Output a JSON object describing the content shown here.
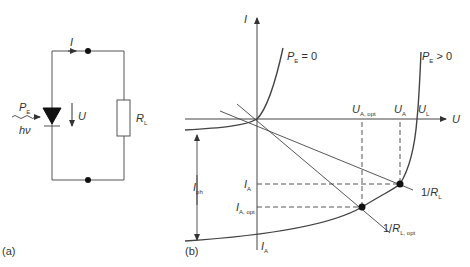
{
  "panel_a": {
    "label": "(a)",
    "current_symbol": "I",
    "voltage_symbol": "U",
    "resistor_symbol": "R",
    "resistor_sub": "L",
    "power_symbol": "P",
    "power_sub": "E",
    "photon_label": "hν"
  },
  "panel_b": {
    "label": "(b)",
    "y_axis": "I",
    "x_axis": "U",
    "curve_dark": {
      "symbol": "P",
      "sub": "E",
      "cond": " = 0"
    },
    "curve_light": {
      "symbol": "P",
      "sub": "E",
      "cond": " > 0"
    },
    "u_a_opt": {
      "symbol": "U",
      "sub": "A, opt"
    },
    "u_a": {
      "symbol": "U",
      "sub": "A"
    },
    "u_l": {
      "symbol": "U",
      "sub": "L"
    },
    "i_a": {
      "symbol": "I",
      "sub": "A"
    },
    "i_a_opt": {
      "symbol": "I",
      "sub": "A, opt"
    },
    "i_ph": {
      "symbol": "I",
      "sub": "ph"
    },
    "i_a_bottom": {
      "symbol": "I",
      "sub": "A"
    },
    "load_line": {
      "prefix": "1/",
      "symbol": "R",
      "sub": "L"
    },
    "load_line_opt": {
      "prefix": "1/",
      "symbol": "R",
      "sub": "L, opt"
    }
  },
  "colors": {
    "line": "#444444",
    "text": "#333333",
    "bg": "#ffffff"
  }
}
